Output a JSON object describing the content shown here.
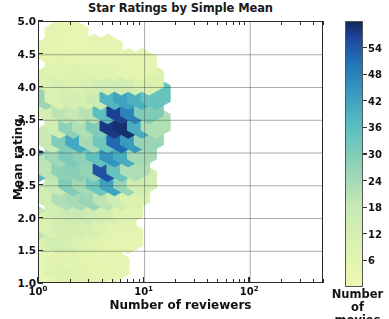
{
  "chart_data": {
    "type": "heatmap",
    "subtype": "hexbin",
    "title": "Star Ratings by Simple Mean",
    "xlabel": "Number of reviewers",
    "ylabel": "Mean rating",
    "xscale": "log",
    "yscale": "linear",
    "xlim": [
      1,
      500
    ],
    "ylim": [
      1.0,
      5.0
    ],
    "grid": true,
    "xtick_labels": [
      "10⁰",
      "10¹",
      "10²"
    ],
    "xtick_values": [
      1,
      10,
      100
    ],
    "ytick_labels": [
      "1.0",
      "1.5",
      "2.0",
      "2.5",
      "3.0",
      "3.5",
      "4.0",
      "4.5",
      "5.0"
    ],
    "ytick_values": [
      1.0,
      1.5,
      2.0,
      2.5,
      3.0,
      3.5,
      4.0,
      4.5,
      5.0
    ],
    "colorbar": {
      "label_line1": "Number of",
      "label_line2": "movies",
      "tick_values": [
        6,
        12,
        18,
        24,
        30,
        36,
        42,
        48,
        54
      ],
      "vmin": 0,
      "vmax": 60,
      "colormap": "YlGnBu",
      "stops": [
        {
          "t": 0.0,
          "hex": "#edf8b1"
        },
        {
          "t": 0.15,
          "hex": "#dcf2b0"
        },
        {
          "t": 0.3,
          "hex": "#c7e9b4"
        },
        {
          "t": 0.45,
          "hex": "#94d3b6"
        },
        {
          "t": 0.6,
          "hex": "#5bbfc0"
        },
        {
          "t": 0.72,
          "hex": "#3a9fc0"
        },
        {
          "t": 0.85,
          "hex": "#2272b6"
        },
        {
          "t": 0.94,
          "hex": "#1f469c"
        },
        {
          "t": 1.0,
          "hex": "#13275e"
        }
      ]
    },
    "hexagons": [
      {
        "col": 0,
        "row": 0,
        "x_log": 0.0,
        "y": 1.05,
        "count": 60
      },
      {
        "col": 1,
        "row": 0,
        "x_log": 0.13,
        "y": 1.05,
        "count": 4
      },
      {
        "col": 2,
        "row": 0,
        "x_log": 0.26,
        "y": 1.05,
        "count": 6
      },
      {
        "col": 3,
        "row": 0,
        "x_log": 0.39,
        "y": 1.05,
        "count": 5
      },
      {
        "col": 4,
        "row": 0,
        "x_log": 0.52,
        "y": 1.05,
        "count": 4
      },
      {
        "col": 1,
        "row": 1,
        "x_log": 0.065,
        "y": 1.27,
        "count": 3
      },
      {
        "col": 2,
        "row": 1,
        "x_log": 0.195,
        "y": 1.27,
        "count": 8
      },
      {
        "col": 3,
        "row": 1,
        "x_log": 0.325,
        "y": 1.27,
        "count": 9
      },
      {
        "col": 4,
        "row": 1,
        "x_log": 0.455,
        "y": 1.27,
        "count": 7
      },
      {
        "col": 5,
        "row": 1,
        "x_log": 0.585,
        "y": 1.27,
        "count": 5
      },
      {
        "col": 6,
        "row": 1,
        "x_log": 0.715,
        "y": 1.27,
        "count": 4
      },
      {
        "col": 2,
        "row": 2,
        "x_log": 0.26,
        "y": 1.49,
        "count": 6
      },
      {
        "col": 3,
        "row": 2,
        "x_log": 0.39,
        "y": 1.49,
        "count": 7
      },
      {
        "col": 4,
        "row": 2,
        "x_log": 0.52,
        "y": 1.49,
        "count": 5
      },
      {
        "col": 5,
        "row": 2,
        "x_log": 0.65,
        "y": 1.49,
        "count": 4
      },
      {
        "col": 1,
        "row": 3,
        "x_log": 0.065,
        "y": 1.71,
        "count": 9
      },
      {
        "col": 2,
        "row": 3,
        "x_log": 0.195,
        "y": 1.71,
        "count": 14
      },
      {
        "col": 3,
        "row": 3,
        "x_log": 0.325,
        "y": 1.71,
        "count": 12
      },
      {
        "col": 4,
        "row": 3,
        "x_log": 0.455,
        "y": 1.71,
        "count": 9
      },
      {
        "col": 5,
        "row": 3,
        "x_log": 0.585,
        "y": 1.71,
        "count": 7
      },
      {
        "col": 6,
        "row": 3,
        "x_log": 0.715,
        "y": 1.71,
        "count": 5
      },
      {
        "col": 7,
        "row": 3,
        "x_log": 0.845,
        "y": 1.71,
        "count": 4
      },
      {
        "col": 1,
        "row": 4,
        "x_log": 0.0,
        "y": 1.93,
        "count": 20
      },
      {
        "col": 2,
        "row": 4,
        "x_log": 0.13,
        "y": 1.93,
        "count": 10
      },
      {
        "col": 3,
        "row": 4,
        "x_log": 0.26,
        "y": 1.93,
        "count": 13
      },
      {
        "col": 4,
        "row": 4,
        "x_log": 0.39,
        "y": 1.93,
        "count": 12
      },
      {
        "col": 5,
        "row": 4,
        "x_log": 0.52,
        "y": 1.93,
        "count": 11
      },
      {
        "col": 6,
        "row": 4,
        "x_log": 0.65,
        "y": 1.93,
        "count": 9
      },
      {
        "col": 7,
        "row": 4,
        "x_log": 0.78,
        "y": 1.93,
        "count": 6
      },
      {
        "col": 2,
        "row": 5,
        "x_log": 0.195,
        "y": 2.15,
        "count": 13
      },
      {
        "col": 3,
        "row": 5,
        "x_log": 0.325,
        "y": 2.15,
        "count": 16
      },
      {
        "col": 4,
        "row": 5,
        "x_log": 0.455,
        "y": 2.15,
        "count": 17
      },
      {
        "col": 5,
        "row": 5,
        "x_log": 0.585,
        "y": 2.15,
        "count": 14
      },
      {
        "col": 6,
        "row": 5,
        "x_log": 0.715,
        "y": 2.15,
        "count": 12
      },
      {
        "col": 7,
        "row": 5,
        "x_log": 0.845,
        "y": 2.15,
        "count": 8
      },
      {
        "col": 2,
        "row": 6,
        "x_log": 0.13,
        "y": 2.37,
        "count": 14
      },
      {
        "col": 3,
        "row": 6,
        "x_log": 0.26,
        "y": 2.37,
        "count": 22
      },
      {
        "col": 4,
        "row": 6,
        "x_log": 0.39,
        "y": 2.37,
        "count": 24
      },
      {
        "col": 5,
        "row": 6,
        "x_log": 0.52,
        "y": 2.37,
        "count": 26
      },
      {
        "col": 6,
        "row": 6,
        "x_log": 0.65,
        "y": 2.37,
        "count": 20
      },
      {
        "col": 7,
        "row": 6,
        "x_log": 0.78,
        "y": 2.37,
        "count": 15
      },
      {
        "col": 8,
        "row": 6,
        "x_log": 0.91,
        "y": 2.37,
        "count": 9
      },
      {
        "col": 2,
        "row": 7,
        "x_log": 0.195,
        "y": 2.59,
        "count": 18
      },
      {
        "col": 3,
        "row": 7,
        "x_log": 0.325,
        "y": 2.59,
        "count": 30
      },
      {
        "col": 4,
        "row": 7,
        "x_log": 0.455,
        "y": 2.59,
        "count": 24
      },
      {
        "col": 5,
        "row": 7,
        "x_log": 0.585,
        "y": 2.59,
        "count": 33
      },
      {
        "col": 6,
        "row": 7,
        "x_log": 0.715,
        "y": 2.59,
        "count": 42
      },
      {
        "col": 7,
        "row": 7,
        "x_log": 0.845,
        "y": 2.59,
        "count": 26
      },
      {
        "col": 8,
        "row": 7,
        "x_log": 0.975,
        "y": 2.59,
        "count": 14
      },
      {
        "col": 1,
        "row": 8,
        "x_log": 0.0,
        "y": 2.81,
        "count": 37
      },
      {
        "col": 2,
        "row": 8,
        "x_log": 0.13,
        "y": 2.81,
        "count": 20
      },
      {
        "col": 3,
        "row": 8,
        "x_log": 0.26,
        "y": 2.81,
        "count": 28
      },
      {
        "col": 4,
        "row": 8,
        "x_log": 0.39,
        "y": 2.81,
        "count": 29
      },
      {
        "col": 5,
        "row": 8,
        "x_log": 0.52,
        "y": 2.81,
        "count": 27
      },
      {
        "col": 6,
        "row": 8,
        "x_log": 0.65,
        "y": 2.81,
        "count": 55
      },
      {
        "col": 7,
        "row": 8,
        "x_log": 0.78,
        "y": 2.81,
        "count": 34
      },
      {
        "col": 8,
        "row": 8,
        "x_log": 0.91,
        "y": 2.81,
        "count": 22
      },
      {
        "col": 2,
        "row": 9,
        "x_log": 0.195,
        "y": 3.03,
        "count": 25
      },
      {
        "col": 3,
        "row": 9,
        "x_log": 0.325,
        "y": 3.03,
        "count": 31
      },
      {
        "col": 4,
        "row": 9,
        "x_log": 0.455,
        "y": 3.03,
        "count": 28
      },
      {
        "col": 5,
        "row": 9,
        "x_log": 0.585,
        "y": 3.03,
        "count": 35
      },
      {
        "col": 6,
        "row": 9,
        "x_log": 0.715,
        "y": 3.03,
        "count": 45
      },
      {
        "col": 7,
        "row": 9,
        "x_log": 0.845,
        "y": 3.03,
        "count": 40
      },
      {
        "col": 8,
        "row": 9,
        "x_log": 0.975,
        "y": 3.03,
        "count": 24
      },
      {
        "col": 2,
        "row": 10,
        "x_log": 0.13,
        "y": 3.25,
        "count": 17
      },
      {
        "col": 3,
        "row": 10,
        "x_log": 0.26,
        "y": 3.25,
        "count": 30
      },
      {
        "col": 4,
        "row": 10,
        "x_log": 0.39,
        "y": 3.25,
        "count": 41
      },
      {
        "col": 5,
        "row": 10,
        "x_log": 0.52,
        "y": 3.25,
        "count": 24
      },
      {
        "col": 6,
        "row": 10,
        "x_log": 0.65,
        "y": 3.25,
        "count": 33
      },
      {
        "col": 7,
        "row": 10,
        "x_log": 0.78,
        "y": 3.25,
        "count": 52
      },
      {
        "col": 8,
        "row": 10,
        "x_log": 0.91,
        "y": 3.25,
        "count": 44
      },
      {
        "col": 9,
        "row": 10,
        "x_log": 1.04,
        "y": 3.25,
        "count": 26
      },
      {
        "col": 2,
        "row": 11,
        "x_log": 0.195,
        "y": 3.47,
        "count": 14
      },
      {
        "col": 3,
        "row": 11,
        "x_log": 0.325,
        "y": 3.47,
        "count": 28
      },
      {
        "col": 4,
        "row": 11,
        "x_log": 0.455,
        "y": 3.47,
        "count": 22
      },
      {
        "col": 5,
        "row": 11,
        "x_log": 0.585,
        "y": 3.47,
        "count": 30
      },
      {
        "col": 6,
        "row": 11,
        "x_log": 0.715,
        "y": 3.47,
        "count": 58
      },
      {
        "col": 7,
        "row": 11,
        "x_log": 0.845,
        "y": 3.47,
        "count": 59
      },
      {
        "col": 8,
        "row": 11,
        "x_log": 0.975,
        "y": 3.47,
        "count": 40
      },
      {
        "col": 9,
        "row": 11,
        "x_log": 1.105,
        "y": 3.47,
        "count": 22
      },
      {
        "col": 2,
        "row": 12,
        "x_log": 0.13,
        "y": 3.69,
        "count": 12
      },
      {
        "col": 3,
        "row": 12,
        "x_log": 0.26,
        "y": 3.69,
        "count": 20
      },
      {
        "col": 4,
        "row": 12,
        "x_log": 0.39,
        "y": 3.69,
        "count": 18
      },
      {
        "col": 5,
        "row": 12,
        "x_log": 0.52,
        "y": 3.69,
        "count": 21
      },
      {
        "col": 6,
        "row": 12,
        "x_log": 0.65,
        "y": 3.69,
        "count": 36
      },
      {
        "col": 7,
        "row": 12,
        "x_log": 0.78,
        "y": 3.69,
        "count": 57
      },
      {
        "col": 8,
        "row": 12,
        "x_log": 0.91,
        "y": 3.69,
        "count": 48
      },
      {
        "col": 9,
        "row": 12,
        "x_log": 1.04,
        "y": 3.69,
        "count": 30
      },
      {
        "col": 1,
        "row": 13,
        "x_log": 0.065,
        "y": 3.91,
        "count": 26
      },
      {
        "col": 2,
        "row": 13,
        "x_log": 0.195,
        "y": 3.91,
        "count": 10
      },
      {
        "col": 3,
        "row": 13,
        "x_log": 0.325,
        "y": 3.91,
        "count": 13
      },
      {
        "col": 4,
        "row": 13,
        "x_log": 0.455,
        "y": 3.91,
        "count": 12
      },
      {
        "col": 5,
        "row": 13,
        "x_log": 0.585,
        "y": 3.91,
        "count": 16
      },
      {
        "col": 6,
        "row": 13,
        "x_log": 0.715,
        "y": 3.91,
        "count": 38
      },
      {
        "col": 7,
        "row": 13,
        "x_log": 0.845,
        "y": 3.91,
        "count": 42
      },
      {
        "col": 8,
        "row": 13,
        "x_log": 0.975,
        "y": 3.91,
        "count": 39
      },
      {
        "col": 9,
        "row": 13,
        "x_log": 1.105,
        "y": 3.91,
        "count": 34
      },
      {
        "col": 2,
        "row": 14,
        "x_log": 0.13,
        "y": 4.13,
        "count": 9
      },
      {
        "col": 3,
        "row": 14,
        "x_log": 0.26,
        "y": 4.13,
        "count": 11
      },
      {
        "col": 4,
        "row": 14,
        "x_log": 0.39,
        "y": 4.13,
        "count": 10
      },
      {
        "col": 5,
        "row": 14,
        "x_log": 0.52,
        "y": 4.13,
        "count": 12
      },
      {
        "col": 6,
        "row": 14,
        "x_log": 0.65,
        "y": 4.13,
        "count": 14
      },
      {
        "col": 7,
        "row": 14,
        "x_log": 0.78,
        "y": 4.13,
        "count": 15
      },
      {
        "col": 8,
        "row": 14,
        "x_log": 0.91,
        "y": 4.13,
        "count": 13
      },
      {
        "col": 9,
        "row": 14,
        "x_log": 1.04,
        "y": 4.13,
        "count": 10
      },
      {
        "col": 2,
        "row": 15,
        "x_log": 0.195,
        "y": 4.35,
        "count": 7
      },
      {
        "col": 3,
        "row": 15,
        "x_log": 0.325,
        "y": 4.35,
        "count": 8
      },
      {
        "col": 4,
        "row": 15,
        "x_log": 0.455,
        "y": 4.35,
        "count": 9
      },
      {
        "col": 5,
        "row": 15,
        "x_log": 0.585,
        "y": 4.35,
        "count": 8
      },
      {
        "col": 6,
        "row": 15,
        "x_log": 0.715,
        "y": 4.35,
        "count": 7
      },
      {
        "col": 7,
        "row": 15,
        "x_log": 0.845,
        "y": 4.35,
        "count": 6
      },
      {
        "col": 8,
        "row": 15,
        "x_log": 0.975,
        "y": 4.35,
        "count": 5
      },
      {
        "col": 2,
        "row": 16,
        "x_log": 0.13,
        "y": 4.57,
        "count": 5
      },
      {
        "col": 3,
        "row": 16,
        "x_log": 0.26,
        "y": 4.57,
        "count": 6
      },
      {
        "col": 4,
        "row": 16,
        "x_log": 0.39,
        "y": 4.57,
        "count": 5
      },
      {
        "col": 5,
        "row": 16,
        "x_log": 0.52,
        "y": 4.57,
        "count": 4
      },
      {
        "col": 6,
        "row": 16,
        "x_log": 0.65,
        "y": 4.57,
        "count": 4
      },
      {
        "col": 2,
        "row": 17,
        "x_log": 0.195,
        "y": 4.79,
        "count": 4
      },
      {
        "col": 3,
        "row": 17,
        "x_log": 0.325,
        "y": 4.79,
        "count": 3
      }
    ]
  }
}
